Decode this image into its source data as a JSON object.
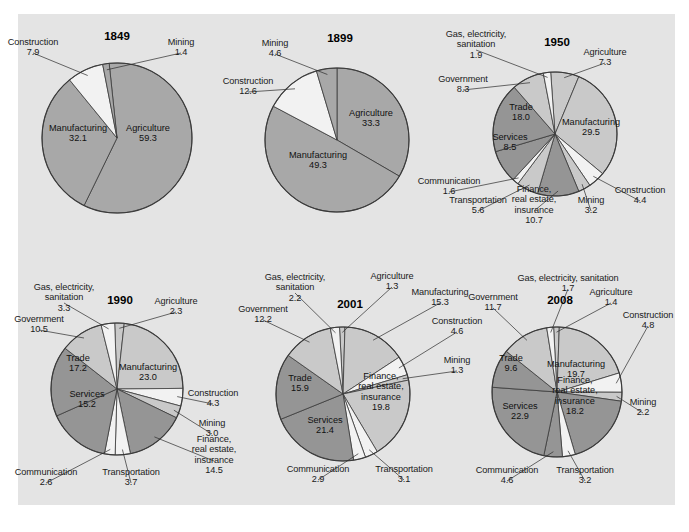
{
  "figure": {
    "background": "#e4e4e4",
    "caption": ""
  },
  "palette": {
    "light": "#c9c9c9",
    "mid": "#a8a8a8",
    "dark": "#959595",
    "white": "#f2f2f2",
    "stroke": "#3a3a3a"
  },
  "chart_data": [
    {
      "type": "pie",
      "title": "1849",
      "unit": "percent",
      "total": 100.1,
      "cx": 117,
      "cy": 138,
      "r": 75,
      "start_angle": -6,
      "categories": [
        "Agriculture",
        "Manufacturing",
        "Construction",
        "Mining"
      ],
      "values": [
        59.3,
        32.1,
        7.9,
        1.4
      ],
      "shades": [
        "mid",
        "mid",
        "white",
        "mid"
      ],
      "labels": [
        {
          "name": "Agriculture",
          "value": "59.3",
          "pos": "inside",
          "x": 148,
          "y": 133,
          "align": "c"
        },
        {
          "name": "Manufacturing",
          "value": "32.1",
          "pos": "inside",
          "x": 78,
          "y": 133,
          "align": "c"
        },
        {
          "name": "Construction",
          "value": "7.9",
          "pos": "outside",
          "x": 33,
          "y": 47,
          "align": "c"
        },
        {
          "name": "Mining",
          "value": "1.4",
          "pos": "outside",
          "x": 181,
          "y": 47,
          "align": "c"
        }
      ],
      "year_pos": {
        "x": 117,
        "y": 36
      }
    },
    {
      "type": "pie",
      "title": "1899",
      "unit": "percent",
      "total": 99.8,
      "cx": 337,
      "cy": 140,
      "r": 72,
      "start_angle": 0,
      "categories": [
        "Agriculture",
        "Manufacturing",
        "Construction",
        "Mining"
      ],
      "values": [
        33.3,
        49.3,
        12.6,
        4.6
      ],
      "shades": [
        "mid",
        "mid",
        "white",
        "mid"
      ],
      "labels": [
        {
          "name": "Agriculture",
          "value": "33.3",
          "pos": "inside",
          "x": 371,
          "y": 118,
          "align": "c"
        },
        {
          "name": "Manufacturing",
          "value": "49.3",
          "pos": "inside",
          "x": 318,
          "y": 160,
          "align": "c"
        },
        {
          "name": "Construction",
          "value": "12.6",
          "pos": "outside",
          "x": 248,
          "y": 86,
          "align": "c"
        },
        {
          "name": "Mining",
          "value": "4.6",
          "pos": "outside",
          "x": 275,
          "y": 48,
          "align": "c"
        }
      ],
      "year_pos": {
        "x": 340,
        "y": 38
      }
    },
    {
      "type": "pie",
      "title": "1950",
      "unit": "percent",
      "total": 99.5,
      "cx": 555,
      "cy": 134,
      "r": 62,
      "start_angle": -4,
      "categories": [
        "Agriculture",
        "Manufacturing",
        "Construction",
        "Mining",
        "Finance, real estate, insurance",
        "Transportation",
        "Communication",
        "Services",
        "Trade",
        "Government",
        "Gas, electricity, sanitation"
      ],
      "values": [
        7.3,
        29.5,
        4.4,
        3.2,
        10.7,
        5.6,
        1.6,
        8.5,
        18.0,
        8.3,
        1.9
      ],
      "shades": [
        "light",
        "light",
        "white",
        "light",
        "dark",
        "light",
        "white",
        "dark",
        "dark",
        "light",
        "white"
      ],
      "labels": [
        {
          "name": "Agriculture",
          "value": "7.3",
          "pos": "outside",
          "x": 605,
          "y": 57,
          "align": "c"
        },
        {
          "name": "Manufacturing",
          "value": "29.5",
          "pos": "inside",
          "x": 591,
          "y": 127,
          "align": "c"
        },
        {
          "name": "Construction",
          "value": "4.4",
          "pos": "outside",
          "x": 640,
          "y": 195,
          "align": "c"
        },
        {
          "name": "Mining",
          "value": "3.2",
          "pos": "outside",
          "x": 591,
          "y": 205,
          "align": "c"
        },
        {
          "name": "Finance,\nreal estate,\ninsurance",
          "value": "10.7",
          "pos": "outside",
          "x": 534,
          "y": 205,
          "align": "c"
        },
        {
          "name": "Transportation",
          "value": "5.6",
          "pos": "outside",
          "x": 478,
          "y": 205,
          "align": "c"
        },
        {
          "name": "Communication",
          "value": "1.6",
          "pos": "outside",
          "x": 449,
          "y": 186,
          "align": "c"
        },
        {
          "name": "Services",
          "value": "8.5",
          "pos": "inside",
          "x": 510,
          "y": 142,
          "align": "c"
        },
        {
          "name": "Trade",
          "value": "18.0",
          "pos": "inside",
          "x": 521,
          "y": 112,
          "align": "c"
        },
        {
          "name": "Government",
          "value": "8.3",
          "pos": "outside",
          "x": 463,
          "y": 84,
          "align": "c"
        },
        {
          "name": "Gas, electricity,\nsanitation",
          "value": "1.9",
          "pos": "outside",
          "x": 476,
          "y": 44,
          "align": "c"
        }
      ],
      "year_pos": {
        "x": 557,
        "y": 42
      }
    },
    {
      "type": "pie",
      "title": "1990",
      "unit": "percent",
      "total": 100.1,
      "cx": 117,
      "cy": 389,
      "r": 66,
      "start_angle": -2,
      "categories": [
        "Agriculture",
        "Manufacturing",
        "Construction",
        "Mining",
        "Finance, real estate, insurance",
        "Transportation",
        "Communication",
        "Services",
        "Trade",
        "Government",
        "Gas, electricity, sanitation"
      ],
      "values": [
        2.3,
        23.0,
        4.3,
        3.0,
        14.5,
        3.7,
        2.6,
        15.2,
        17.2,
        10.5,
        3.3
      ],
      "shades": [
        "light",
        "light",
        "white",
        "light",
        "dark",
        "white",
        "white",
        "dark",
        "dark",
        "light",
        "white"
      ],
      "labels": [
        {
          "name": "Agriculture",
          "value": "2.3",
          "pos": "outside",
          "x": 176,
          "y": 306,
          "align": "c"
        },
        {
          "name": "Manufacturing",
          "value": "23.0",
          "pos": "inside",
          "x": 148,
          "y": 372,
          "align": "c"
        },
        {
          "name": "Construction",
          "value": "4.3",
          "pos": "outside",
          "x": 213,
          "y": 398,
          "align": "c"
        },
        {
          "name": "Mining",
          "value": "3.0",
          "pos": "outside",
          "x": 212,
          "y": 428,
          "align": "c"
        },
        {
          "name": "Finance,\nreal estate,\ninsurance",
          "value": "14.5",
          "pos": "outside",
          "x": 214,
          "y": 455,
          "align": "c"
        },
        {
          "name": "Transportation",
          "value": "3.7",
          "pos": "outside",
          "x": 131,
          "y": 477,
          "align": "c"
        },
        {
          "name": "Communication",
          "value": "2.6",
          "pos": "outside",
          "x": 46,
          "y": 477,
          "align": "c"
        },
        {
          "name": "Services",
          "value": "15.2",
          "pos": "inside",
          "x": 87,
          "y": 399,
          "align": "c"
        },
        {
          "name": "Trade",
          "value": "17.2",
          "pos": "inside",
          "x": 78,
          "y": 363,
          "align": "c"
        },
        {
          "name": "Government",
          "value": "10.5",
          "pos": "outside",
          "x": 39,
          "y": 324,
          "align": "c"
        },
        {
          "name": "Gas, electricity,\nsanitation",
          "value": "3.3",
          "pos": "outside",
          "x": 64,
          "y": 297,
          "align": "c"
        }
      ],
      "year_pos": {
        "x": 120,
        "y": 300
      }
    },
    {
      "type": "pie",
      "title": "2001",
      "unit": "percent",
      "total": 100.0,
      "cx": 343,
      "cy": 394,
      "r": 67,
      "start_angle": -3,
      "categories": [
        "Agriculture",
        "Manufacturing",
        "Construction",
        "Mining",
        "Finance, real estate, insurance",
        "Transportation",
        "Communication",
        "Services",
        "Trade",
        "Government",
        "Gas, electricity, sanitation"
      ],
      "values": [
        1.3,
        15.3,
        4.6,
        1.3,
        19.8,
        3.1,
        2.9,
        21.4,
        15.9,
        12.2,
        2.2
      ],
      "shades": [
        "light",
        "light",
        "white",
        "light",
        "light",
        "white",
        "white",
        "dark",
        "dark",
        "light",
        "white"
      ],
      "labels": [
        {
          "name": "Agriculture",
          "value": "1.3",
          "pos": "outside",
          "x": 392,
          "y": 281,
          "align": "c"
        },
        {
          "name": "Manufacturing",
          "value": "15.3",
          "pos": "outside",
          "x": 440,
          "y": 297,
          "align": "c"
        },
        {
          "name": "Construction",
          "value": "4.6",
          "pos": "outside",
          "x": 457,
          "y": 326,
          "align": "c"
        },
        {
          "name": "Mining",
          "value": "1.3",
          "pos": "outside",
          "x": 457,
          "y": 365,
          "align": "c"
        },
        {
          "name": "Finance,\nreal estate,\ninsurance",
          "value": "19.8",
          "pos": "inside",
          "x": 381,
          "y": 392,
          "align": "c"
        },
        {
          "name": "Transportation",
          "value": "3.1",
          "pos": "outside",
          "x": 404,
          "y": 474,
          "align": "c"
        },
        {
          "name": "Communication",
          "value": "2.9",
          "pos": "outside",
          "x": 318,
          "y": 474,
          "align": "c"
        },
        {
          "name": "Services",
          "value": "21.4",
          "pos": "inside",
          "x": 325,
          "y": 425,
          "align": "c"
        },
        {
          "name": "Trade",
          "value": "15.9",
          "pos": "inside",
          "x": 300,
          "y": 383,
          "align": "c"
        },
        {
          "name": "Government",
          "value": "12.2",
          "pos": "outside",
          "x": 263,
          "y": 314,
          "align": "c"
        },
        {
          "name": "Gas, electricity,\nsanitation",
          "value": "2.2",
          "pos": "outside",
          "x": 295,
          "y": 287,
          "align": "c"
        }
      ],
      "year_pos": {
        "x": 350,
        "y": 304
      }
    },
    {
      "type": "pie",
      "title": "2008",
      "unit": "percent",
      "total": 100.0,
      "cx": 557,
      "cy": 392,
      "r": 65,
      "start_angle": -3,
      "categories": [
        "Agriculture",
        "Manufacturing",
        "Construction",
        "Mining",
        "Finance, real estate, insurance",
        "Transportation",
        "Communication",
        "Services",
        "Trade",
        "Government",
        "Gas, electricity, sanitation"
      ],
      "values": [
        1.4,
        19.7,
        4.8,
        2.2,
        18.2,
        3.2,
        4.6,
        22.9,
        9.6,
        11.7,
        1.7
      ],
      "shades": [
        "light",
        "light",
        "white",
        "light",
        "dark",
        "white",
        "dark",
        "dark",
        "dark",
        "light",
        "white"
      ],
      "labels": [
        {
          "name": "Agriculture",
          "value": "1.4",
          "pos": "outside",
          "x": 611,
          "y": 297,
          "align": "c"
        },
        {
          "name": "Manufacturing",
          "value": "19.7",
          "pos": "inside",
          "x": 576,
          "y": 369,
          "align": "c"
        },
        {
          "name": "Construction",
          "value": "4.8",
          "pos": "outside",
          "x": 648,
          "y": 320,
          "align": "c"
        },
        {
          "name": "Mining",
          "value": "2.2",
          "pos": "outside",
          "x": 643,
          "y": 407,
          "align": "c"
        },
        {
          "name": "Finance,\nreal estate,\ninsurance",
          "value": "18.2",
          "pos": "inside",
          "x": 575,
          "y": 396,
          "align": "c"
        },
        {
          "name": "Transportation",
          "value": "3.2",
          "pos": "outside",
          "x": 585,
          "y": 475,
          "align": "c"
        },
        {
          "name": "Communication",
          "value": "4.6",
          "pos": "outside",
          "x": 507,
          "y": 475,
          "align": "c"
        },
        {
          "name": "Services",
          "value": "22.9",
          "pos": "inside",
          "x": 520,
          "y": 411,
          "align": "c"
        },
        {
          "name": "Trade",
          "value": "9.6",
          "pos": "inside",
          "x": 511,
          "y": 363,
          "align": "c"
        },
        {
          "name": "Government",
          "value": "11.7",
          "pos": "outside",
          "x": 493,
          "y": 302,
          "align": "c"
        },
        {
          "name": "Gas, electricity, sanitation",
          "value": "1.7",
          "pos": "outside",
          "x": 568,
          "y": 283,
          "align": "c"
        }
      ],
      "year_pos": {
        "x": 560,
        "y": 300
      }
    }
  ]
}
